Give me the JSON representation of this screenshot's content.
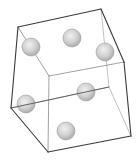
{
  "diagram": {
    "title": "",
    "type": "wireframe-cube-with-spheres",
    "width": 140,
    "height": 166,
    "colors": {
      "background": "#ffffff",
      "outer_edge": "#3a3a3a",
      "inner_edge": "#8a8a8a",
      "hidden_edge": "#a5a5a5",
      "sphere_light": "#e8e8e8",
      "sphere_mid": "#cfcfcf",
      "sphere_dark": "#a8a8a8",
      "sphere_stroke": "#9a9a9a"
    },
    "vertices": {
      "A": [
        18,
        27
      ],
      "B": [
        101,
        9
      ],
      "C": [
        124,
        62
      ],
      "D": [
        131,
        136
      ],
      "E": [
        48,
        152
      ],
      "F": [
        11,
        108
      ],
      "G": [
        49,
        76
      ],
      "H": [
        109,
        87
      ]
    },
    "edges": {
      "outer": [
        [
          "A",
          "B"
        ],
        [
          "B",
          "C"
        ],
        [
          "C",
          "D"
        ],
        [
          "D",
          "E"
        ],
        [
          "E",
          "F"
        ],
        [
          "F",
          "A"
        ]
      ],
      "inner_visible": [
        [
          "G",
          "A"
        ],
        [
          "G",
          "C"
        ],
        [
          "G",
          "E"
        ]
      ],
      "hidden": [
        [
          "H",
          "B"
        ],
        [
          "H",
          "D"
        ],
        [
          "H",
          "F"
        ]
      ]
    },
    "spheres": [
      {
        "id": 1,
        "cx": 31,
        "cy": 47,
        "r": 9
      },
      {
        "id": 2,
        "cx": 72,
        "cy": 38,
        "r": 9
      },
      {
        "id": 3,
        "cx": 105,
        "cy": 52,
        "r": 9
      },
      {
        "id": 4,
        "cx": 86,
        "cy": 92,
        "r": 9
      },
      {
        "id": 5,
        "cx": 26,
        "cy": 104,
        "r": 9
      },
      {
        "id": 6,
        "cx": 66,
        "cy": 131,
        "r": 9
      }
    ]
  }
}
